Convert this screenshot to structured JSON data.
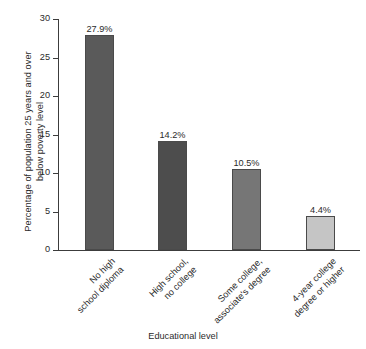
{
  "chart_data": {
    "type": "bar",
    "title": "",
    "subtitle": "",
    "xlabel": "Educational level",
    "ylabel": "Percentage of population 25 years and over below poverty level",
    "ylabel_lines": [
      "Percentage of population 25 years and over",
      "below poverty level"
    ],
    "categories": [
      "No high school diploma",
      "High school, no college",
      "Some college, associate's degree",
      "4-year college degree or higher"
    ],
    "category_lines": [
      [
        "No high",
        "school diploma"
      ],
      [
        "High school,",
        "no college"
      ],
      [
        "Some college,",
        "associate's degree"
      ],
      [
        "4-year college",
        "degree or higher"
      ]
    ],
    "values": [
      27.9,
      14.2,
      10.5,
      4.4
    ],
    "value_labels": [
      "27.9%",
      "14.2%",
      "10.5%",
      "4.4%"
    ],
    "bar_colors": [
      "#5a5a5a",
      "#4d4d4d",
      "#767676",
      "#c5c5c5"
    ],
    "ylim": [
      0,
      30
    ],
    "yticks": [
      0,
      5,
      10,
      15,
      20,
      25,
      30
    ],
    "ytick_labels": [
      "0",
      "5",
      "10",
      "15",
      "20",
      "25",
      "30"
    ],
    "grid": false,
    "legend": false,
    "legend_position": "none",
    "axis_color": "#3c3c3c",
    "text_color": "#2b2b2b",
    "background": "#ffffff"
  }
}
